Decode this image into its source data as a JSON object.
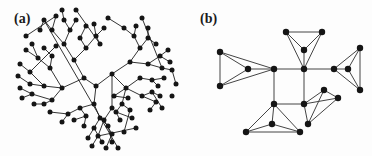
{
  "figure": {
    "width": 372,
    "height": 156,
    "background_color": "#fdfdfd",
    "ink_color": "#151515",
    "panels": [
      {
        "id": "a",
        "label": "(a)",
        "caption_label": "(a)",
        "description": "radial hierarchical tree (dendrogram) with central root and recursively branching subtrees terminating in filled circular leaf nodes"
      },
      {
        "id": "b",
        "label": "(b)",
        "caption_label": "(b)",
        "description": "modular graph of five densely connected four-node clusters joined in a cross pattern by single bridging edges"
      }
    ]
  },
  "chart_data": {
    "type": "diagram",
    "title": "",
    "xlabel": "",
    "ylabel": "",
    "panel_a": {
      "type": "graph",
      "layout": "radial-tree",
      "node_count": 97,
      "edge_count": 96,
      "node_radius": 2.5,
      "edge_width": 0.9,
      "node_color": "#151515",
      "edge_color": "#1d1d1d",
      "root": 0,
      "nodes": [
        [
          96,
          86
        ],
        [
          84,
          78
        ],
        [
          112,
          74
        ],
        [
          74,
          60
        ],
        [
          62,
          88
        ],
        [
          94,
          104
        ],
        [
          130,
          62
        ],
        [
          126,
          88
        ],
        [
          112,
          108
        ],
        [
          64,
          44
        ],
        [
          86,
          48
        ],
        [
          50,
          68
        ],
        [
          44,
          86
        ],
        [
          52,
          100
        ],
        [
          80,
          108
        ],
        [
          100,
          118
        ],
        [
          140,
          48
        ],
        [
          148,
          64
        ],
        [
          140,
          78
        ],
        [
          114,
          96
        ],
        [
          142,
          96
        ],
        [
          122,
          104
        ],
        [
          104,
          120
        ],
        [
          52,
          30
        ],
        [
          70,
          30
        ],
        [
          80,
          38
        ],
        [
          96,
          36
        ],
        [
          38,
          58
        ],
        [
          52,
          56
        ],
        [
          30,
          72
        ],
        [
          30,
          84
        ],
        [
          32,
          94
        ],
        [
          44,
          104
        ],
        [
          68,
          114
        ],
        [
          86,
          116
        ],
        [
          94,
          128
        ],
        [
          108,
          126
        ],
        [
          134,
          36
        ],
        [
          148,
          38
        ],
        [
          160,
          56
        ],
        [
          162,
          68
        ],
        [
          152,
          80
        ],
        [
          128,
          98
        ],
        [
          152,
          92
        ],
        [
          156,
          102
        ],
        [
          116,
          112
        ],
        [
          130,
          110
        ],
        [
          98,
          136
        ],
        [
          112,
          134
        ],
        [
          44,
          20
        ],
        [
          56,
          16
        ],
        [
          64,
          20
        ],
        [
          76,
          20
        ],
        [
          86,
          26
        ],
        [
          94,
          24
        ],
        [
          104,
          28
        ],
        [
          100,
          44
        ],
        [
          26,
          50
        ],
        [
          32,
          44
        ],
        [
          44,
          48
        ],
        [
          56,
          46
        ],
        [
          20,
          64
        ],
        [
          18,
          76
        ],
        [
          20,
          88
        ],
        [
          22,
          98
        ],
        [
          34,
          104
        ],
        [
          50,
          112
        ],
        [
          62,
          122
        ],
        [
          74,
          120
        ],
        [
          84,
          126
        ],
        [
          88,
          138
        ],
        [
          102,
          142
        ],
        [
          112,
          142
        ],
        [
          124,
          28
        ],
        [
          136,
          26
        ],
        [
          148,
          28
        ],
        [
          156,
          44
        ],
        [
          168,
          50
        ],
        [
          170,
          62
        ],
        [
          172,
          70
        ],
        [
          164,
          78
        ],
        [
          158,
          86
        ],
        [
          160,
          96
        ],
        [
          162,
          108
        ],
        [
          150,
          110
        ],
        [
          120,
          120
        ],
        [
          132,
          118
        ],
        [
          124,
          132
        ],
        [
          136,
          128
        ],
        [
          92,
          146
        ],
        [
          106,
          148
        ],
        [
          118,
          148
        ],
        [
          40,
          30
        ],
        [
          26,
          36
        ],
        [
          62,
          10
        ],
        [
          76,
          10
        ],
        [
          108,
          18
        ],
        [
          142,
          18
        ],
        [
          176,
          84
        ],
        [
          172,
          96
        ]
      ],
      "edges": [
        [
          0,
          1
        ],
        [
          0,
          2
        ],
        [
          0,
          5
        ],
        [
          1,
          3
        ],
        [
          1,
          4
        ],
        [
          2,
          6
        ],
        [
          2,
          7
        ],
        [
          2,
          8
        ],
        [
          3,
          9
        ],
        [
          3,
          10
        ],
        [
          4,
          11
        ],
        [
          4,
          12
        ],
        [
          4,
          13
        ],
        [
          5,
          14
        ],
        [
          5,
          15
        ],
        [
          6,
          16
        ],
        [
          6,
          17
        ],
        [
          7,
          18
        ],
        [
          7,
          19
        ],
        [
          7,
          20
        ],
        [
          7,
          21
        ],
        [
          8,
          22
        ],
        [
          9,
          23
        ],
        [
          9,
          24
        ],
        [
          10,
          25
        ],
        [
          10,
          26
        ],
        [
          11,
          27
        ],
        [
          11,
          28
        ],
        [
          12,
          29
        ],
        [
          12,
          30
        ],
        [
          13,
          31
        ],
        [
          13,
          32
        ],
        [
          14,
          33
        ],
        [
          14,
          34
        ],
        [
          15,
          35
        ],
        [
          15,
          36
        ],
        [
          16,
          37
        ],
        [
          16,
          38
        ],
        [
          17,
          39
        ],
        [
          17,
          40
        ],
        [
          18,
          41
        ],
        [
          19,
          42
        ],
        [
          20,
          43
        ],
        [
          20,
          44
        ],
        [
          21,
          45
        ],
        [
          21,
          46
        ],
        [
          22,
          47
        ],
        [
          22,
          48
        ],
        [
          23,
          49
        ],
        [
          23,
          50
        ],
        [
          24,
          51
        ],
        [
          24,
          52
        ],
        [
          25,
          53
        ],
        [
          26,
          54
        ],
        [
          26,
          55
        ],
        [
          26,
          56
        ],
        [
          27,
          57
        ],
        [
          27,
          58
        ],
        [
          28,
          59
        ],
        [
          29,
          60
        ],
        [
          29,
          61
        ],
        [
          30,
          62
        ],
        [
          31,
          63
        ],
        [
          31,
          64
        ],
        [
          32,
          65
        ],
        [
          33,
          66
        ],
        [
          33,
          67
        ],
        [
          34,
          68
        ],
        [
          34,
          69
        ],
        [
          35,
          70
        ],
        [
          35,
          71
        ],
        [
          36,
          72
        ],
        [
          37,
          73
        ],
        [
          37,
          74
        ],
        [
          38,
          75
        ],
        [
          38,
          76
        ],
        [
          39,
          77
        ],
        [
          39,
          78
        ],
        [
          40,
          79
        ],
        [
          41,
          80
        ],
        [
          41,
          81
        ],
        [
          43,
          82
        ],
        [
          43,
          83
        ],
        [
          44,
          84
        ],
        [
          45,
          85
        ],
        [
          45,
          86
        ],
        [
          46,
          87
        ],
        [
          47,
          88
        ],
        [
          47,
          89
        ],
        [
          48,
          90
        ],
        [
          49,
          91
        ],
        [
          49,
          92
        ],
        [
          50,
          93
        ],
        [
          51,
          94
        ],
        [
          56,
          95
        ],
        [
          73,
          96
        ],
        [
          40,
          97
        ],
        [
          79,
          98
        ]
      ]
    },
    "panel_b": {
      "type": "graph",
      "layout": "modular-cross",
      "node_count": 20,
      "edge_count": 34,
      "node_radius": 3.2,
      "edge_width": 1.0,
      "node_color": "#151515",
      "edge_color": "#444444",
      "clusters": 5,
      "cluster_size": 4,
      "nodes": [
        [
          30,
          52
        ],
        [
          30,
          86
        ],
        [
          58,
          69
        ],
        [
          84,
          69
        ],
        [
          96,
          32
        ],
        [
          132,
          32
        ],
        [
          114,
          50
        ],
        [
          114,
          69
        ],
        [
          114,
          104
        ],
        [
          84,
          104
        ],
        [
          82,
          124
        ],
        [
          56,
          132
        ],
        [
          110,
          132
        ],
        [
          144,
          69
        ],
        [
          170,
          48
        ],
        [
          170,
          90
        ],
        [
          158,
          69
        ],
        [
          134,
          90
        ],
        [
          118,
          124
        ],
        [
          148,
          98
        ]
      ],
      "hubs": [
        3,
        7,
        9,
        8,
        13
      ],
      "bridges": [
        [
          3,
          7
        ],
        [
          7,
          13
        ],
        [
          7,
          8
        ],
        [
          9,
          3
        ]
      ],
      "edges": [
        [
          0,
          1
        ],
        [
          0,
          2
        ],
        [
          1,
          2
        ],
        [
          0,
          3
        ],
        [
          1,
          3
        ],
        [
          2,
          3
        ],
        [
          4,
          5
        ],
        [
          4,
          6
        ],
        [
          5,
          6
        ],
        [
          4,
          7
        ],
        [
          5,
          7
        ],
        [
          6,
          7
        ],
        [
          3,
          7
        ],
        [
          7,
          13
        ],
        [
          13,
          14
        ],
        [
          13,
          15
        ],
        [
          13,
          16
        ],
        [
          14,
          15
        ],
        [
          14,
          16
        ],
        [
          15,
          16
        ],
        [
          3,
          9
        ],
        [
          7,
          8
        ],
        [
          9,
          8
        ],
        [
          9,
          10
        ],
        [
          9,
          11
        ],
        [
          9,
          12
        ],
        [
          10,
          11
        ],
        [
          10,
          12
        ],
        [
          11,
          12
        ],
        [
          8,
          17
        ],
        [
          8,
          18
        ],
        [
          8,
          19
        ],
        [
          17,
          18
        ],
        [
          17,
          19
        ],
        [
          18,
          19
        ]
      ]
    }
  }
}
